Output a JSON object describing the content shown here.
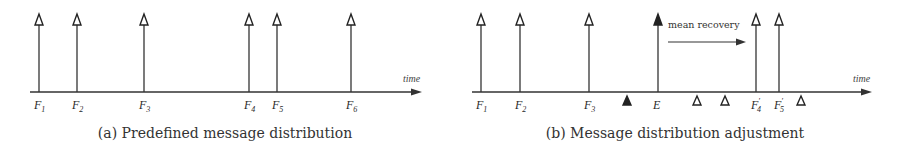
{
  "panels": [
    {
      "id": "a",
      "caption": "(a) Predefined message distribution",
      "axis_label": "time",
      "messages": [
        {
          "label": "F",
          "sub": "1",
          "prime": "",
          "x": 39
        },
        {
          "label": "F",
          "sub": "2",
          "prime": "",
          "x": 77
        },
        {
          "label": "F",
          "sub": "3",
          "prime": "",
          "x": 144
        },
        {
          "label": "F",
          "sub": "4",
          "prime": "",
          "x": 249
        },
        {
          "label": "F",
          "sub": "5",
          "prime": "",
          "x": 277
        },
        {
          "label": "F",
          "sub": "6",
          "prime": "",
          "x": 351
        }
      ]
    },
    {
      "id": "b",
      "caption": "(b) Message distribution adjustment",
      "axis_label": "time",
      "annotation": "mean recovery",
      "messages": [
        {
          "label": "F",
          "sub": "1",
          "prime": "",
          "x": 481
        },
        {
          "label": "F",
          "sub": "2",
          "prime": "",
          "x": 520
        },
        {
          "label": "F",
          "sub": "3",
          "prime": "",
          "x": 589
        },
        {
          "label": "E",
          "sub": "",
          "prime": "",
          "x": 658,
          "filled": true
        },
        {
          "label": "F",
          "sub": "4",
          "prime": "′",
          "x": 756
        },
        {
          "label": "F",
          "sub": "5",
          "prime": "′",
          "x": 779
        }
      ],
      "markers": [
        {
          "x": 627,
          "filled": true
        },
        {
          "x": 697,
          "filled": false
        },
        {
          "x": 725,
          "filled": false
        },
        {
          "x": 801,
          "filled": false
        }
      ]
    }
  ]
}
